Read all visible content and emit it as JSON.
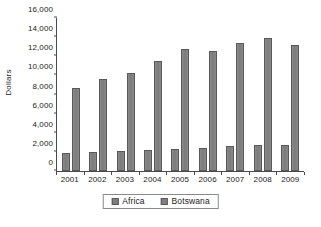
{
  "chart_data": {
    "type": "bar",
    "title": "",
    "subtitle": "",
    "xlabel": "",
    "ylabel": "Dollars",
    "categories": [
      "2001",
      "2002",
      "2003",
      "2004",
      "2005",
      "2006",
      "2007",
      "2008",
      "2009"
    ],
    "series": [
      {
        "name": "Africa",
        "values": [
          1900,
          1950,
          2050,
          2150,
          2350,
          2450,
          2600,
          2700,
          2750
        ]
      },
      {
        "name": "Botswana",
        "values": [
          8700,
          9600,
          10300,
          11500,
          12800,
          12500,
          13400,
          13900,
          13200
        ]
      }
    ],
    "ylim": [
      0,
      16000
    ],
    "ytick_step": 2000,
    "ytick_labels": [
      "0",
      "2,000",
      "4,000",
      "6,000",
      "8,000",
      "10,000",
      "12,000",
      "14,000",
      "16,000"
    ],
    "grid": false,
    "legend_position": "bottom",
    "colors": {
      "bar_fill": "#7f7f7f",
      "bar_stroke": "#595959",
      "axis": "#4a4a4a",
      "text": "#1a1a1a",
      "background": "#ffffff",
      "legend_border": "#8a8a8a"
    }
  }
}
